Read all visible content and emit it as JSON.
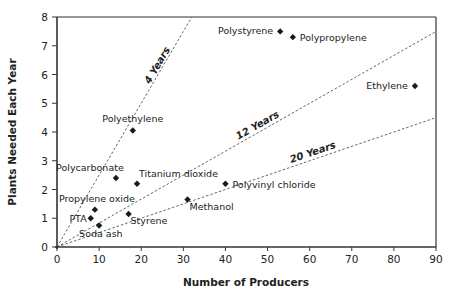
{
  "chart_data": {
    "type": "scatter",
    "title": "",
    "xlabel": "Number of Producers",
    "ylabel": "Plants Needed Each Year",
    "xlim": [
      0,
      90
    ],
    "ylim": [
      0,
      8
    ],
    "xticks": [
      0,
      10,
      20,
      30,
      40,
      50,
      60,
      70,
      80,
      90
    ],
    "yticks": [
      0,
      1,
      2,
      3,
      4,
      5,
      6,
      7,
      8
    ],
    "grid": false,
    "legend": null,
    "points": [
      {
        "label": "Polystyrene",
        "x": 53,
        "y": 7.5,
        "label_side": "left"
      },
      {
        "label": "Polypropylene",
        "x": 56,
        "y": 7.3,
        "label_side": "right"
      },
      {
        "label": "Ethylene",
        "x": 85,
        "y": 5.6,
        "label_side": "left"
      },
      {
        "label": "Polyethylene",
        "x": 18,
        "y": 4.05,
        "label_side": "above"
      },
      {
        "label": "Polycarbonate",
        "x": 14,
        "y": 2.4,
        "label_side": "above-left"
      },
      {
        "label": "Titanium dioxide",
        "x": 19,
        "y": 2.2,
        "label_side": "above-right"
      },
      {
        "label": "Polyvinyl chloride",
        "x": 40,
        "y": 2.2,
        "label_side": "right"
      },
      {
        "label": "Methanol",
        "x": 31,
        "y": 1.65,
        "label_side": "below-right"
      },
      {
        "label": "Styrene",
        "x": 17,
        "y": 1.15,
        "label_side": "below-right"
      },
      {
        "label": "Propylene oxide",
        "x": 9,
        "y": 1.3,
        "label_side": "above"
      },
      {
        "label": "PTA",
        "x": 8,
        "y": 1.0,
        "label_side": "left"
      },
      {
        "label": "Soda ash",
        "x": 10,
        "y": 0.75,
        "label_side": "below"
      }
    ],
    "reference_lines": [
      {
        "label": "4 Years",
        "slope": 0.25,
        "x_end": 32
      },
      {
        "label": "12 Years",
        "slope": 0.0833,
        "x_end": 90
      },
      {
        "label": "20 Years",
        "slope": 0.05,
        "x_end": 90
      }
    ]
  },
  "colors": {
    "axis": "#333333",
    "marker": "#1a1a1a",
    "ref_line": "#555555",
    "text": "#222222"
  }
}
